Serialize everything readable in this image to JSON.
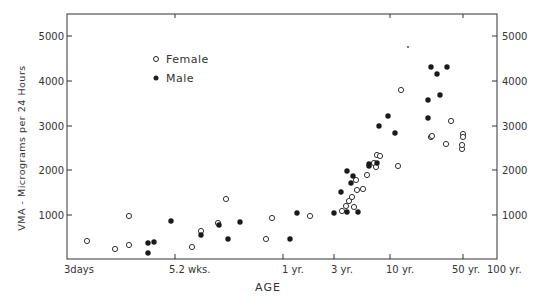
{
  "chart_data": {
    "type": "scatter",
    "title": "",
    "xlabel": "AGE",
    "ylabel": "VMA - Micrograms per 24 Hours",
    "x_scale": "log (age)",
    "x_ticks": [
      {
        "label": "3days",
        "px": 67
      },
      {
        "label": "5.2 wks.",
        "px": 175
      },
      {
        "label": "1 yr.",
        "px": 283
      },
      {
        "label": "3 yr.",
        "px": 334
      },
      {
        "label": "10 yr.",
        "px": 390
      },
      {
        "label": "50 yr.",
        "px": 463
      },
      {
        "label": "100 yr.",
        "px": 497
      }
    ],
    "y_ticks": [
      1000,
      2000,
      3000,
      4000,
      5000
    ],
    "y_tick_labels": [
      "1000",
      "2000",
      "3000",
      "4000",
      "5000"
    ],
    "ylim": [
      0,
      5450
    ],
    "grid": false,
    "right_axis_mirrored": true,
    "legend": {
      "position": "upper-left",
      "entries": [
        {
          "label": "Female",
          "marker": "open-circle"
        },
        {
          "label": "Male",
          "marker": "filled-circle"
        }
      ]
    },
    "series": [
      {
        "name": "Female",
        "marker": "open-circle",
        "points_px": [
          [
            87,
            241
          ],
          [
            115,
            249
          ],
          [
            129,
            245
          ],
          [
            129,
            216
          ],
          [
            192,
            247
          ],
          [
            201,
            231
          ],
          [
            218,
            223
          ],
          [
            226,
            199
          ],
          [
            266,
            239
          ],
          [
            272,
            218
          ],
          [
            310,
            216
          ],
          [
            342,
            211
          ],
          [
            346,
            206
          ],
          [
            349,
            201
          ],
          [
            352,
            197
          ],
          [
            357,
            190
          ],
          [
            354,
            207
          ],
          [
            356,
            180
          ],
          [
            363,
            189
          ],
          [
            367,
            175
          ],
          [
            374,
            163
          ],
          [
            376,
            167
          ],
          [
            377,
            155
          ],
          [
            380,
            156
          ],
          [
            398,
            166
          ],
          [
            401,
            90
          ],
          [
            431,
            137
          ],
          [
            432,
            136
          ],
          [
            446,
            144
          ],
          [
            451,
            121
          ],
          [
            462,
            149
          ],
          [
            463,
            134
          ],
          [
            463,
            137
          ],
          [
            462,
            145
          ]
        ],
        "values_approx": [
          {
            "age": "~4 days",
            "vma": 420
          },
          {
            "age": "~8 days",
            "vma": 250
          },
          {
            "age": "~12 days",
            "vma": 330
          },
          {
            "age": "~12 days",
            "vma": 980
          },
          {
            "age": "~7 wks",
            "vma": 290
          },
          {
            "age": "~2 mo",
            "vma": 650
          },
          {
            "age": "~3 mo",
            "vma": 830
          },
          {
            "age": "~4 mo",
            "vma": 1360
          },
          {
            "age": "~8 mo",
            "vma": 470
          },
          {
            "age": "~9 mo",
            "vma": 940
          },
          {
            "age": "~2 yr",
            "vma": 980
          },
          {
            "age": "~4 yr",
            "vma": 1090
          },
          {
            "age": "~4 yr",
            "vma": 1200
          },
          {
            "age": "~4.5 yr",
            "vma": 1320
          },
          {
            "age": "~5 yr",
            "vma": 1410
          },
          {
            "age": "~5.5 yr",
            "vma": 1560
          },
          {
            "age": "~5 yr",
            "vma": 1180
          },
          {
            "age": "~5.5 yr",
            "vma": 1790
          },
          {
            "age": "~6 yr",
            "vma": 1590
          },
          {
            "age": "~7 yr",
            "vma": 1900
          },
          {
            "age": "~8 yr",
            "vma": 2170
          },
          {
            "age": "~8 yr",
            "vma": 2080
          },
          {
            "age": "~8.5 yr",
            "vma": 2340
          },
          {
            "age": "~9 yr",
            "vma": 2320
          },
          {
            "age": "~12 yr",
            "vma": 2100
          },
          {
            "age": "~13 yr",
            "vma": 3790
          },
          {
            "age": "~25 yr",
            "vma": 2740
          },
          {
            "age": "~25 yr",
            "vma": 2770
          },
          {
            "age": "~33 yr",
            "vma": 2590
          },
          {
            "age": "~38 yr",
            "vma": 3100
          },
          {
            "age": "~50 yr",
            "vma": 2480
          },
          {
            "age": "~50 yr",
            "vma": 2830
          },
          {
            "age": "~50 yr",
            "vma": 2760
          },
          {
            "age": "~50 yr",
            "vma": 2570
          }
        ]
      },
      {
        "name": "Male",
        "marker": "filled-circle",
        "points_px": [
          [
            148,
            243
          ],
          [
            148,
            253
          ],
          [
            154,
            242
          ],
          [
            171,
            221
          ],
          [
            201,
            235
          ],
          [
            219,
            225
          ],
          [
            228,
            239
          ],
          [
            240,
            222
          ],
          [
            290,
            239
          ],
          [
            297,
            213
          ],
          [
            334,
            213
          ],
          [
            341,
            192
          ],
          [
            347,
            171
          ],
          [
            347,
            212
          ],
          [
            351,
            183
          ],
          [
            353,
            176
          ],
          [
            358,
            212
          ],
          [
            369,
            166
          ],
          [
            369,
            164
          ],
          [
            377,
            163
          ],
          [
            379,
            126
          ],
          [
            388,
            116
          ],
          [
            395,
            133
          ],
          [
            428,
            100
          ],
          [
            428,
            118
          ],
          [
            431,
            67
          ],
          [
            437,
            74
          ],
          [
            440,
            95
          ],
          [
            447,
            67
          ]
        ],
        "values_approx": [
          {
            "age": "~3 wks",
            "vma": 380
          },
          {
            "age": "~3 wks",
            "vma": 160
          },
          {
            "age": "~3.5 wks",
            "vma": 400
          },
          {
            "age": "~5 wks",
            "vma": 870
          },
          {
            "age": "~2 mo",
            "vma": 560
          },
          {
            "age": "~3 mo",
            "vma": 780
          },
          {
            "age": "~4 mo",
            "vma": 470
          },
          {
            "age": "~5 mo",
            "vma": 850
          },
          {
            "age": "~1.1 yr",
            "vma": 470
          },
          {
            "age": "~1.3 yr",
            "vma": 1050
          },
          {
            "age": "~3 yr",
            "vma": 1050
          },
          {
            "age": "~4 yr",
            "vma": 1520
          },
          {
            "age": "~4.5 yr",
            "vma": 1990
          },
          {
            "age": "~4.5 yr",
            "vma": 1070
          },
          {
            "age": "~5 yr",
            "vma": 1720
          },
          {
            "age": "~5 yr",
            "vma": 1880
          },
          {
            "age": "~6 yr",
            "vma": 1070
          },
          {
            "age": "~7.5 yr",
            "vma": 2100
          },
          {
            "age": "~7.5 yr",
            "vma": 2140
          },
          {
            "age": "~9 yr",
            "vma": 2170
          },
          {
            "age": "~9 yr",
            "vma": 2990
          },
          {
            "age": "~11 yr",
            "vma": 3210
          },
          {
            "age": "~12 yr",
            "vma": 2830
          },
          {
            "age": "~25 yr",
            "vma": 3570
          },
          {
            "age": "~25 yr",
            "vma": 3170
          },
          {
            "age": "~27 yr",
            "vma": 4310
          },
          {
            "age": "~30 yr",
            "vma": 4150
          },
          {
            "age": "~32 yr",
            "vma": 3680
          },
          {
            "age": "~38 yr",
            "vma": 4310
          }
        ]
      }
    ],
    "annotations": [
      {
        "type": "dot",
        "px": [
          408,
          47
        ],
        "note": "small stray mark"
      }
    ]
  },
  "labels": {
    "y_title": "VMA - Micrograms per 24 Hours",
    "x_title": "AGE",
    "legend_female": "Female",
    "legend_male": "Male",
    "xt0": "3days",
    "xt1": "5.2 wks.",
    "xt2": "1 yr.",
    "xt3": "3 yr.",
    "xt4": "10 yr.",
    "xt5": "50 yr.",
    "xt6": "100 yr.",
    "yt1": "1000",
    "yt2": "2000",
    "yt3": "3000",
    "yt4": "4000",
    "yt5": "5000"
  },
  "colors": {
    "ink": "#222222",
    "background": "#ffffff"
  }
}
